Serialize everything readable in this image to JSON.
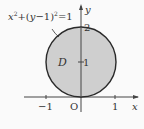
{
  "equation": {
    "main": "x²+(y−1)²=1"
  },
  "region_label": "D",
  "axes": {
    "x_label": "x",
    "y_label": "y",
    "origin_label": "O",
    "x_ticks": [
      "−1",
      "1"
    ],
    "y_ticks": [
      "1",
      "2"
    ]
  },
  "colors": {
    "fill": "#cfcfcf",
    "stroke": "#2a2a2a",
    "axis": "#444444"
  }
}
